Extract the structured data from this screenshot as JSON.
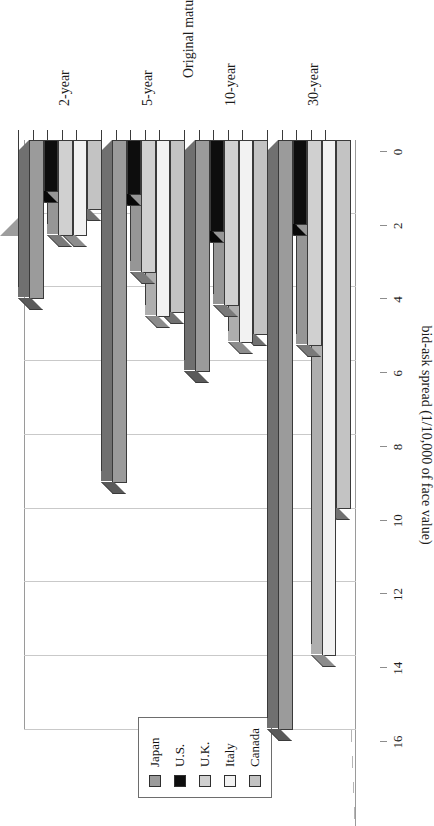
{
  "chart_data": {
    "type": "bar",
    "orientation": "horizontal",
    "title": "",
    "xlabel": "bid-ask spread (1/10,000 of face value)",
    "ylabel": "Original maturity",
    "categories": [
      "2-year",
      "5-year",
      "10-year",
      "30-year"
    ],
    "value_axis_ticks": [
      0,
      2,
      4,
      6,
      8,
      10,
      12,
      14,
      16
    ],
    "xlim": [
      0,
      16
    ],
    "grid": true,
    "legend_position": "right",
    "series": [
      {
        "name": "Japan",
        "color": "#9b9b9b",
        "values": [
          4.3,
          9.3,
          6.3,
          16.0
        ]
      },
      {
        "name": "U.S.",
        "color": "#0d0d0d",
        "values": [
          1.4,
          1.5,
          2.5,
          2.3
        ]
      },
      {
        "name": "U.K.",
        "color": "#d0d0d0",
        "values": [
          2.6,
          3.6,
          4.5,
          5.6
        ]
      },
      {
        "name": "Italy",
        "color": "#f2f2f2",
        "values": [
          2.6,
          4.8,
          5.5,
          14.0
        ]
      },
      {
        "name": "Canada",
        "color": "#c3c3c3",
        "values": [
          1.9,
          4.7,
          5.3,
          10.0
        ]
      }
    ]
  },
  "legend": {
    "items": [
      {
        "label": "Japan"
      },
      {
        "label": "U.S."
      },
      {
        "label": "U.K."
      },
      {
        "label": "Italy"
      },
      {
        "label": "Canada"
      }
    ]
  },
  "axes": {
    "value_axis_title": "bid-ask spread (1/10,000 of face value)",
    "category_axis_title": "Original maturity"
  }
}
